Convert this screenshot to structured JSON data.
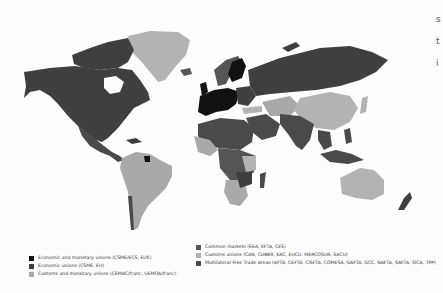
{
  "map": {
    "colors": {
      "ocean": "#fdfdfd",
      "economic_monetary_union": "#111111",
      "economic_union": "#3f3f3f",
      "customs_monetary_union": "#a9a9a9",
      "common_market": "#555555",
      "customs_union": "#b3b3b3",
      "multilateral_fta": "#4a4a4a"
    }
  },
  "legend": {
    "left": [
      {
        "label": "Economic and monetary unions (CSME/ECS, EU€)",
        "color": "#111111"
      },
      {
        "label": "Economic unions (CSME, EU)",
        "color": "#3f3f3f"
      },
      {
        "label": "Customs and monetary unions (CEMAC/franc, UEMOA/franc)",
        "color": "#a9a9a9"
      }
    ],
    "right": [
      {
        "label": "Common markets (EEA, EFTA, CES)",
        "color": "#555555"
      },
      {
        "label": "Customs unions (CAN, CUBKR, EAC, EUCU, MERCOSUR, SACU)",
        "color": "#b3b3b3"
      },
      {
        "label": "Multilateral Free Trade Areas (AFTA, CEFTA, CISFTA, COMESA, GAFTA, GCC, NAFTA, SAFTA, SICA, TPP)",
        "color": "#4a4a4a"
      }
    ]
  },
  "edge_fragments": [
    "s",
    "t",
    "i"
  ]
}
